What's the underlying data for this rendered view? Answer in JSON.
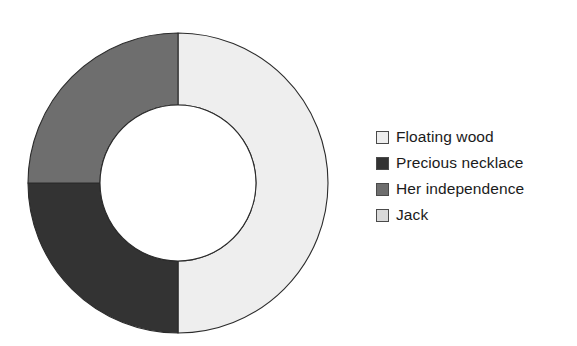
{
  "chart_data": {
    "type": "pie",
    "variant": "donut",
    "title": "",
    "xlabel": "",
    "ylabel": "",
    "categories": [
      "Floating wood",
      "Precious necklace",
      "Her independence",
      "Jack"
    ],
    "values": [
      50,
      25,
      25,
      0
    ],
    "value_unit": "percent",
    "start_angle_deg": 0,
    "direction": "clockwise",
    "inner_radius_ratio": 0.52,
    "grid": false,
    "legend_position": "right",
    "slices": [
      {
        "label": "Floating wood",
        "value": 50,
        "color": "#eeeeee",
        "start_deg": 0,
        "end_deg": 180
      },
      {
        "label": "Precious necklace",
        "value": 25,
        "color": "#333333",
        "start_deg": 180,
        "end_deg": 270
      },
      {
        "label": "Her independence",
        "value": 25,
        "color": "#6e6e6e",
        "start_deg": 270,
        "end_deg": 360
      },
      {
        "label": "Jack",
        "value": 0,
        "color": "#d9d9d9",
        "start_deg": 360,
        "end_deg": 360
      }
    ]
  },
  "legend": {
    "items": [
      {
        "label": "Floating wood",
        "color": "#eeeeee"
      },
      {
        "label": "Precious necklace",
        "color": "#333333"
      },
      {
        "label": "Her independence",
        "color": "#6e6e6e"
      },
      {
        "label": "Jack",
        "color": "#d9d9d9"
      }
    ]
  },
  "colors": {
    "background": "#ffffff",
    "outline": "#2b2b2b",
    "text": "#1b1b1b",
    "hole": "#ffffff"
  }
}
